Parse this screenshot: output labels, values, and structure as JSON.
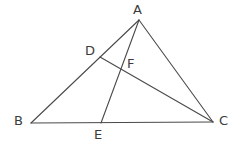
{
  "figure": {
    "canvas": {
      "width": 242,
      "height": 146
    },
    "background_color": "#ffffff",
    "stroke_color": "#4a4a4a",
    "label_color": "#3b3b3b",
    "stroke_width": 1.1,
    "points": {
      "A": {
        "label": "A",
        "x": 139,
        "y": 20,
        "label_x": 133,
        "label_y": 3
      },
      "B": {
        "label": "B",
        "x": 31,
        "y": 123,
        "label_x": 14,
        "label_y": 114
      },
      "C": {
        "label": "C",
        "x": 213,
        "y": 122,
        "label_x": 219,
        "label_y": 114
      },
      "D": {
        "label": "D",
        "x": 100,
        "y": 57,
        "label_x": 85,
        "label_y": 44
      },
      "E": {
        "label": "E",
        "x": 101,
        "y": 123,
        "label_x": 94,
        "label_y": 128
      },
      "F": {
        "label": "F",
        "x": 120,
        "y": 66,
        "label_x": 127,
        "label_y": 57
      }
    },
    "segments": [
      {
        "name": "segment-AB",
        "from": "A",
        "to": "B",
        "x1": 139,
        "y1": 20,
        "x2": 31,
        "y2": 123
      },
      {
        "name": "segment-BC",
        "from": "B",
        "to": "C",
        "x1": 31,
        "y1": 123,
        "x2": 213,
        "y2": 122
      },
      {
        "name": "segment-AC",
        "from": "A",
        "to": "C",
        "x1": 139,
        "y1": 20,
        "x2": 213,
        "y2": 122
      },
      {
        "name": "segment-AE",
        "from": "A",
        "to": "E",
        "x1": 139,
        "y1": 20,
        "x2": 101,
        "y2": 123
      },
      {
        "name": "segment-DC",
        "from": "D",
        "to": "C",
        "x1": 100,
        "y1": 57,
        "x2": 213,
        "y2": 122
      }
    ]
  }
}
